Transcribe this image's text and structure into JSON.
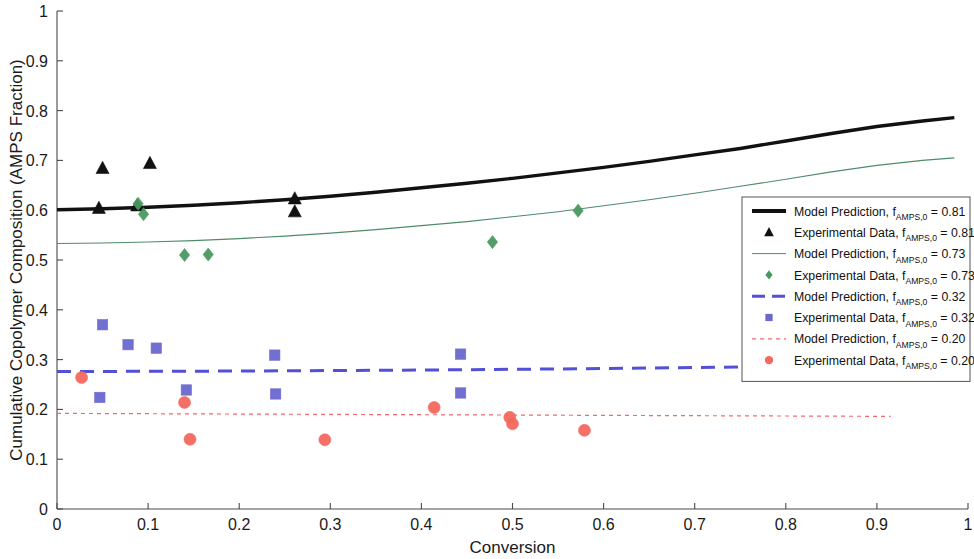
{
  "chart_data": {
    "type": "scatter",
    "title": "",
    "xlabel": "Conversion",
    "ylabel": "Cumulative Copolymer Composition (AMPS Fraction)",
    "xlim": [
      0,
      1
    ],
    "ylim": [
      0,
      1
    ],
    "xticks": [
      "0",
      "0.1",
      "0.2",
      "0.3",
      "0.4",
      "0.5",
      "0.6",
      "0.7",
      "0.8",
      "0.9",
      "1"
    ],
    "yticks": [
      "0",
      "0.1",
      "0.2",
      "0.3",
      "0.4",
      "0.5",
      "0.6",
      "0.7",
      "0.8",
      "0.9",
      "1"
    ],
    "grid": false,
    "legend_position": "right-middle",
    "series": [
      {
        "name": "Model Prediction, f_AMPS,0 = 0.81",
        "kind": "line",
        "style": "solid",
        "color": "#111111",
        "width": 3.4,
        "points": [
          [
            0.0,
            0.601
          ],
          [
            0.05,
            0.603
          ],
          [
            0.1,
            0.606
          ],
          [
            0.15,
            0.61
          ],
          [
            0.2,
            0.615
          ],
          [
            0.25,
            0.621
          ],
          [
            0.3,
            0.628
          ],
          [
            0.35,
            0.636
          ],
          [
            0.4,
            0.645
          ],
          [
            0.45,
            0.654
          ],
          [
            0.5,
            0.664
          ],
          [
            0.55,
            0.675
          ],
          [
            0.6,
            0.686
          ],
          [
            0.65,
            0.698
          ],
          [
            0.7,
            0.711
          ],
          [
            0.75,
            0.724
          ],
          [
            0.8,
            0.739
          ],
          [
            0.85,
            0.754
          ],
          [
            0.9,
            0.768
          ],
          [
            0.95,
            0.779
          ],
          [
            0.985,
            0.786
          ]
        ]
      },
      {
        "name": "Experimental Data, f_AMPS,0 = 0.81",
        "kind": "marker",
        "marker": "triangle",
        "color": "#111111",
        "points": [
          [
            0.05,
            0.684
          ],
          [
            0.102,
            0.694
          ],
          [
            0.046,
            0.604
          ],
          [
            0.088,
            0.609
          ],
          [
            0.261,
            0.623
          ],
          [
            0.261,
            0.597
          ]
        ]
      },
      {
        "name": "Model Prediction, f_AMPS,0 = 0.73",
        "kind": "line",
        "style": "solid",
        "color": "#4e8c6a",
        "width": 1.1,
        "points": [
          [
            0.0,
            0.533
          ],
          [
            0.05,
            0.534
          ],
          [
            0.1,
            0.536
          ],
          [
            0.15,
            0.539
          ],
          [
            0.2,
            0.543
          ],
          [
            0.25,
            0.548
          ],
          [
            0.3,
            0.554
          ],
          [
            0.35,
            0.561
          ],
          [
            0.4,
            0.569
          ],
          [
            0.45,
            0.577
          ],
          [
            0.5,
            0.587
          ],
          [
            0.55,
            0.597
          ],
          [
            0.6,
            0.609
          ],
          [
            0.65,
            0.621
          ],
          [
            0.7,
            0.634
          ],
          [
            0.75,
            0.648
          ],
          [
            0.8,
            0.662
          ],
          [
            0.85,
            0.677
          ],
          [
            0.9,
            0.69
          ],
          [
            0.95,
            0.7
          ],
          [
            0.985,
            0.705
          ]
        ]
      },
      {
        "name": "Experimental Data, f_AMPS,0 = 0.73",
        "kind": "marker",
        "marker": "diamond",
        "color": "#4a9960",
        "points": [
          [
            0.089,
            0.613
          ],
          [
            0.095,
            0.592
          ],
          [
            0.14,
            0.51
          ],
          [
            0.166,
            0.511
          ],
          [
            0.478,
            0.536
          ],
          [
            0.572,
            0.599
          ]
        ]
      },
      {
        "name": "Model Prediction, f_AMPS,0 = 0.32",
        "kind": "line",
        "style": "dashed",
        "color": "#5350d8",
        "width": 3.0,
        "points": [
          [
            0.0,
            0.276
          ],
          [
            0.2,
            0.277
          ],
          [
            0.4,
            0.279
          ],
          [
            0.6,
            0.282
          ],
          [
            0.75,
            0.285
          ],
          [
            0.85,
            0.288
          ],
          [
            0.93,
            0.291
          ]
        ]
      },
      {
        "name": "Experimental Data, f_AMPS,0 = 0.32",
        "kind": "marker",
        "marker": "square",
        "color": "#6a68cf",
        "points": [
          [
            0.05,
            0.37
          ],
          [
            0.047,
            0.224
          ],
          [
            0.078,
            0.33
          ],
          [
            0.109,
            0.323
          ],
          [
            0.142,
            0.239
          ],
          [
            0.239,
            0.309
          ],
          [
            0.24,
            0.231
          ],
          [
            0.443,
            0.311
          ],
          [
            0.443,
            0.233
          ]
        ]
      },
      {
        "name": "Model Prediction, f_AMPS,0 = 0.20",
        "kind": "line",
        "style": "dotted",
        "color": "#f26a6a",
        "width": 1.2,
        "points": [
          [
            0.0,
            0.192
          ],
          [
            0.3,
            0.19
          ],
          [
            0.6,
            0.188
          ],
          [
            0.915,
            0.186
          ]
        ]
      },
      {
        "name": "Experimental Data, f_AMPS,0 = 0.20",
        "kind": "marker",
        "marker": "circle",
        "color": "#f4695e",
        "points": [
          [
            0.027,
            0.264
          ],
          [
            0.14,
            0.214
          ],
          [
            0.146,
            0.14
          ],
          [
            0.294,
            0.139
          ],
          [
            0.414,
            0.204
          ],
          [
            0.497,
            0.184
          ],
          [
            0.5,
            0.171
          ],
          [
            0.579,
            0.158
          ]
        ]
      }
    ],
    "legend_entries": [
      {
        "icon": "thick-solid-line",
        "color": "#111111",
        "label_main": "Model Prediction, f",
        "label_sub": "AMPS,0",
        "label_tail": " = 0.81"
      },
      {
        "icon": "triangle-marker",
        "color": "#111111",
        "label_main": "Experimental Data, f",
        "label_sub": "AMPS,0",
        "label_tail": " = 0.81"
      },
      {
        "icon": "thin-solid-line",
        "color": "#4e8c6a",
        "label_main": "Model Prediction, f",
        "label_sub": "AMPS,0",
        "label_tail": " = 0.73"
      },
      {
        "icon": "diamond-marker",
        "color": "#4a9960",
        "label_main": "Experimental Data, f",
        "label_sub": "AMPS,0",
        "label_tail": " = 0.73"
      },
      {
        "icon": "dashed-line",
        "color": "#5350d8",
        "label_main": "Model Prediction, f",
        "label_sub": "AMPS,0",
        "label_tail": " = 0.32"
      },
      {
        "icon": "square-marker",
        "color": "#6a68cf",
        "label_main": "Experimental Data, f",
        "label_sub": "AMPS,0",
        "label_tail": " = 0.32"
      },
      {
        "icon": "dotted-line",
        "color": "#f26a6a",
        "label_main": "Model Prediction, f",
        "label_sub": "AMPS,0",
        "label_tail": " = 0.20"
      },
      {
        "icon": "circle-marker",
        "color": "#f4695e",
        "label_main": "Experimental Data, f",
        "label_sub": "AMPS,0",
        "label_tail": " = 0.20"
      }
    ]
  }
}
